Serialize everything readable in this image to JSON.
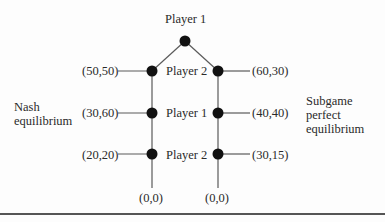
{
  "diagram": {
    "type": "game-tree",
    "root_label": "Player 1",
    "node_labels": [
      "Player 2",
      "Player 1",
      "Player 2"
    ],
    "left_payoffs": [
      "(50,50)",
      "(30,60)",
      "(20,20)"
    ],
    "right_payoffs": [
      "(60,30)",
      "(40,40)",
      "(30,15)"
    ],
    "left_terminal": "(0,0)",
    "right_terminal": "(0,0)",
    "left_annotation": [
      "Nash",
      "equilibrium"
    ],
    "right_annotation": [
      "Subgame",
      "perfect",
      "equilibrium"
    ],
    "colors": {
      "node": "#111111",
      "line": "#555555",
      "text": "#2a2a2a"
    }
  }
}
